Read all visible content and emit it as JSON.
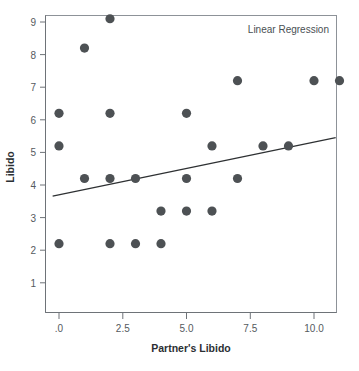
{
  "chart_data": {
    "type": "scatter",
    "title": "",
    "annotation": "Linear Regression",
    "xlabel": "Partner's Libido",
    "ylabel": "Libido",
    "xlim": [
      -0.55,
      11.7
    ],
    "ylim": [
      0.3,
      9.6
    ],
    "grid": false,
    "legend_position": "none",
    "xticks": [
      0,
      2.5,
      5,
      7.5,
      10
    ],
    "xtick_labels": [
      ".0",
      "2.5",
      "5.0",
      "7.5",
      "10.0"
    ],
    "yticks": [
      1,
      2,
      3,
      4,
      5,
      6,
      7,
      8,
      9
    ],
    "ytick_labels": [
      "1",
      "2",
      "3",
      "4",
      "5",
      "6",
      "7",
      "8",
      "9"
    ],
    "points": [
      {
        "x": 0,
        "y": 6.2
      },
      {
        "x": 0,
        "y": 5.2
      },
      {
        "x": 0,
        "y": 2.2
      },
      {
        "x": 1,
        "y": 8.2
      },
      {
        "x": 1,
        "y": 4.2
      },
      {
        "x": 2,
        "y": 9.1
      },
      {
        "x": 2,
        "y": 6.2
      },
      {
        "x": 2,
        "y": 4.2
      },
      {
        "x": 2,
        "y": 2.2
      },
      {
        "x": 3,
        "y": 4.2
      },
      {
        "x": 3,
        "y": 2.2
      },
      {
        "x": 4,
        "y": 3.2
      },
      {
        "x": 4,
        "y": 2.2
      },
      {
        "x": 5,
        "y": 6.2
      },
      {
        "x": 5,
        "y": 4.2
      },
      {
        "x": 5,
        "y": 3.2
      },
      {
        "x": 6,
        "y": 5.2
      },
      {
        "x": 6,
        "y": 3.2
      },
      {
        "x": 7,
        "y": 7.2
      },
      {
        "x": 7,
        "y": 4.2
      },
      {
        "x": 8,
        "y": 5.2
      },
      {
        "x": 9,
        "y": 5.2
      },
      {
        "x": 10,
        "y": 7.2
      },
      {
        "x": 11,
        "y": 7.2
      }
    ],
    "fit_line": {
      "name": "Linear Regression",
      "x_start": -0.25,
      "y_start": 3.66,
      "x_end": 10.85,
      "y_end": 5.45
    },
    "colors": {
      "point": "#4d5154",
      "line": "#2e3133",
      "frame": "#8d9298",
      "text": "#2b2f33",
      "tick_text": "#555a5e"
    },
    "point_radius": 4.6
  }
}
